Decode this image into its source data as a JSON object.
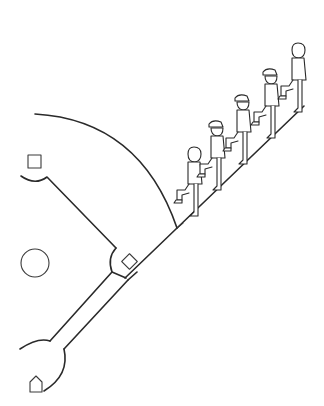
{
  "illustration": {
    "title": "Players marching up the foul line on a baseball field",
    "colors": {
      "line": "#2a2a2a",
      "background": "#ffffff"
    },
    "field": {
      "outfield_arc": "outfield-arc",
      "foul_line": "foul-line",
      "bases": [
        "second-base",
        "first-base",
        "home-plate"
      ],
      "pitchers_mound": "pitchers-mound"
    },
    "players": [
      {
        "id": 1,
        "cap": false
      },
      {
        "id": 2,
        "cap": true
      },
      {
        "id": 3,
        "cap": true
      },
      {
        "id": 4,
        "cap": true
      },
      {
        "id": 5,
        "cap": false
      }
    ]
  }
}
